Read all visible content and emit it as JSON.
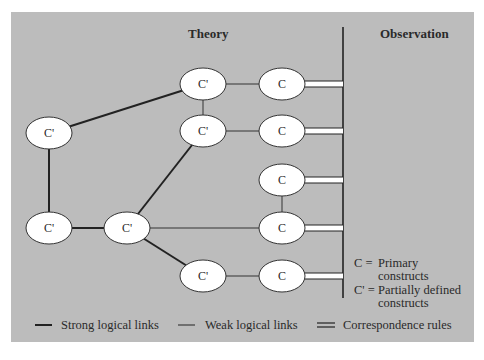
{
  "headers": {
    "theory": "Theory",
    "observation": "Observation"
  },
  "colors": {
    "panel_bg": "#bcbcbc",
    "node_fill": "#ffffff",
    "line": "#222222"
  },
  "nodes": [
    {
      "id": "cp_top",
      "label": "C'",
      "cx": 203,
      "cy": 84
    },
    {
      "id": "c_1",
      "label": "C",
      "cx": 282,
      "cy": 84
    },
    {
      "id": "cp_left",
      "label": "C'",
      "cx": 49,
      "cy": 133
    },
    {
      "id": "cp_mid_upper",
      "label": "C'",
      "cx": 203,
      "cy": 131
    },
    {
      "id": "c_2",
      "label": "C",
      "cx": 282,
      "cy": 131
    },
    {
      "id": "c_3",
      "label": "C",
      "cx": 282,
      "cy": 180
    },
    {
      "id": "cp_bottom_left",
      "label": "C'",
      "cx": 49,
      "cy": 228
    },
    {
      "id": "cp_center",
      "label": "C'",
      "cx": 127,
      "cy": 228
    },
    {
      "id": "c_4",
      "label": "C",
      "cx": 282,
      "cy": 228
    },
    {
      "id": "cp_lower",
      "label": "C'",
      "cx": 203,
      "cy": 276
    },
    {
      "id": "c_5",
      "label": "C",
      "cx": 282,
      "cy": 276
    }
  ],
  "edges": {
    "strong": [
      [
        "cp_left",
        "cp_top"
      ],
      [
        "cp_left",
        "cp_bottom_left"
      ],
      [
        "cp_bottom_left",
        "cp_center"
      ],
      [
        "cp_center",
        "cp_mid_upper"
      ],
      [
        "cp_center",
        "cp_lower"
      ]
    ],
    "weak": [
      [
        "cp_top",
        "c_1"
      ],
      [
        "cp_top",
        "cp_mid_upper"
      ],
      [
        "cp_mid_upper",
        "c_2"
      ],
      [
        "c_3",
        "c_4"
      ],
      [
        "cp_center",
        "c_4"
      ],
      [
        "cp_lower",
        "c_5"
      ]
    ],
    "correspondence": [
      "c_1",
      "c_2",
      "c_3",
      "c_4",
      "c_5"
    ]
  },
  "key": {
    "c_symbol": "C =",
    "c_line1": "Primary",
    "c_line2": "constructs",
    "cp_symbol": "C' =",
    "cp_line1": "Partially defined",
    "cp_line2": "constructs"
  },
  "legend": {
    "strong": "Strong logical links",
    "weak": "Weak logical links",
    "correspondence": "Correspondence rules"
  }
}
